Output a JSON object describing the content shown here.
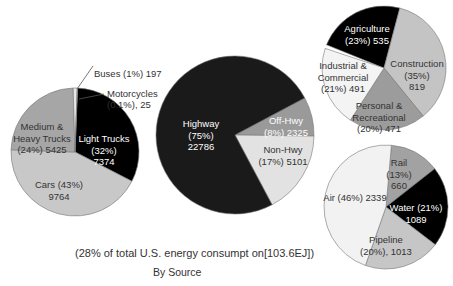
{
  "chart_data": [
    {
      "type": "pie",
      "title": "Highway",
      "center": [
        75,
        152
      ],
      "radius": 64,
      "start_angle": 2,
      "slices": [
        {
          "name": "Light Trucks",
          "percent": 32,
          "value": 7374,
          "color": "#000000",
          "text_color": "#ffffff",
          "label": [
            "Light Trucks",
            "(32%)",
            "7374"
          ],
          "lx": 104,
          "ly": 139
        },
        {
          "name": "Cars",
          "percent": 43,
          "value": 9764,
          "color": "#c8c8c8",
          "text_color": "#333333",
          "label": [
            "Cars (43%)",
            "9764"
          ],
          "lx": 59,
          "ly": 185
        },
        {
          "name": "Medium & Heavy Trucks",
          "percent": 24,
          "value": 5425,
          "color": "#a6a6a6",
          "text_color": "#333333",
          "label": [
            "Medium &",
            "Heavy Trucks",
            "(24%) 5425"
          ],
          "lx": 42,
          "ly": 127
        },
        {
          "name": "Buses",
          "percent": 1,
          "value": 197,
          "color": "#e8e8e8",
          "text_color": "#333333",
          "label": [],
          "lx": 0,
          "ly": 0
        },
        {
          "name": "Motorcycles",
          "percent": 0.1,
          "value": 25,
          "color": "#ffffff",
          "text_color": "#333333",
          "label": [],
          "lx": 0,
          "ly": 0
        }
      ]
    },
    {
      "type": "pie",
      "title": "Transportation",
      "center": [
        235,
        135
      ],
      "radius": 79,
      "start_angle": 62,
      "slices": [
        {
          "name": "Off-Hwy",
          "percent": 8,
          "value": 2325,
          "color": "#9a9a9a",
          "text_color": "#ffffff",
          "label": [
            "Off-Hwy",
            "(8%) 2325"
          ],
          "lx": 286,
          "ly": 121
        },
        {
          "name": "Non-Hwy",
          "percent": 17,
          "value": 5101,
          "color": "#e2e2e2",
          "text_color": "#333333",
          "label": [
            "Non-Hwy",
            "(17%) 5101"
          ],
          "lx": 283,
          "ly": 150
        },
        {
          "name": "Highway",
          "percent": 75,
          "value": 22786,
          "color": "#1a1a1a",
          "text_color": "#ffffff",
          "label": [
            "Highway",
            "(75%)",
            "22786"
          ],
          "lx": 201,
          "ly": 124
        }
      ]
    },
    {
      "type": "pie",
      "title": "Off-Highway",
      "center": [
        384,
        68
      ],
      "radius": 62,
      "start_angle": -68,
      "slices": [
        {
          "name": "Agriculture",
          "percent": 23,
          "value": 535,
          "color": "#000000",
          "text_color": "#ffffff",
          "label": [
            "Agriculture",
            "(23%) 535"
          ],
          "lx": 367,
          "ly": 29
        },
        {
          "name": "Construction",
          "percent": 35,
          "value": 819,
          "color": "#c4c4c4",
          "text_color": "#333333",
          "label": [
            "Construction",
            "(35%)",
            "819"
          ],
          "lx": 417,
          "ly": 64
        },
        {
          "name": "Personal & Recreational",
          "percent": 20,
          "value": 471,
          "color": "#9c9c9c",
          "text_color": "#333333",
          "label": [
            "Personal &",
            "Recreational",
            "(20%) 471"
          ],
          "lx": 379,
          "ly": 106
        },
        {
          "name": "Industrial & Commercial",
          "percent": 21,
          "value": 491,
          "color": "#f4f4f4",
          "text_color": "#333333",
          "label": [
            "Industrial &",
            "Commercial",
            "(21%) 491"
          ],
          "lx": 343,
          "ly": 66
        }
      ]
    },
    {
      "type": "pie",
      "title": "Non-Highway",
      "center": [
        386,
        207
      ],
      "radius": 62,
      "start_angle": 5,
      "slices": [
        {
          "name": "Rail",
          "percent": 13,
          "value": 660,
          "color": "#a2a2a2",
          "text_color": "#333333",
          "label": [
            "Rail",
            "(13%)",
            "660"
          ],
          "lx": 399,
          "ly": 163
        },
        {
          "name": "Water",
          "percent": 21,
          "value": 1089,
          "color": "#000000",
          "text_color": "#ffffff",
          "label": [
            "Water (21%)",
            "1089"
          ],
          "lx": 416,
          "ly": 208
        },
        {
          "name": "Pipeline",
          "percent": 20,
          "value": 1013,
          "color": "#c6c6c6",
          "text_color": "#333333",
          "label": [
            "Pipeline",
            "(20%), 1013"
          ],
          "lx": 386,
          "ly": 240
        },
        {
          "name": "Air",
          "percent": 46,
          "value": 2339,
          "color": "#f2f2f2",
          "text_color": "#333333",
          "label": [
            "Air (46%) 2339"
          ],
          "lx": 355,
          "ly": 198
        }
      ]
    }
  ],
  "callouts": {
    "buses": "Buses (1%) 197",
    "motorcycles_line1": "Motorcycles",
    "motorcycles_line2": "(0.1%), 25"
  },
  "caption": {
    "line1": "(28% of total U.S. energy consumpt on[103.6EJ])",
    "line2": "By Source"
  }
}
